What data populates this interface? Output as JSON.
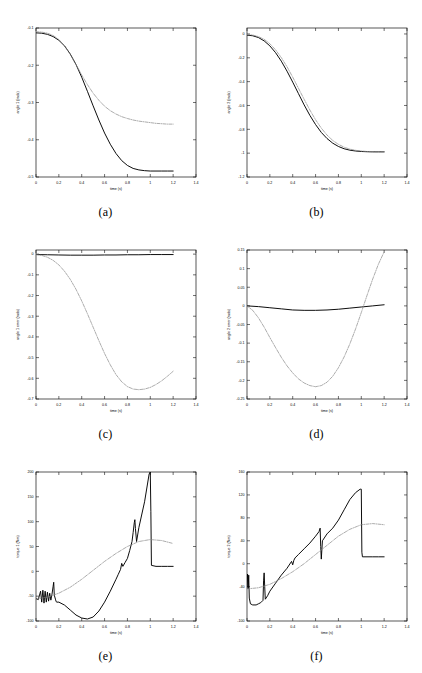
{
  "figure": {
    "name": "six-panel-simulation-results",
    "panels": [
      {
        "id": "a",
        "caption": "(a)"
      },
      {
        "id": "b",
        "caption": "(b)"
      },
      {
        "id": "c",
        "caption": "(c)"
      },
      {
        "id": "d",
        "caption": "(d)"
      },
      {
        "id": "e",
        "caption": "(e)"
      },
      {
        "id": "f",
        "caption": "(f)"
      }
    ]
  },
  "chart_data": [
    {
      "id": "a",
      "type": "line",
      "title": "",
      "xlabel": "time (s)",
      "ylabel": "angle 1 (rads)",
      "xlim": [
        0,
        1.4
      ],
      "ylim": [
        -0.5,
        -0.1
      ],
      "xticks": [
        0,
        0.2,
        0.4,
        0.6,
        0.8,
        1,
        1.2,
        1.4
      ],
      "xticklabels": [
        "0",
        "0.2",
        "0.4",
        "0.6",
        "0.8",
        "1",
        "1.2",
        "1.4"
      ],
      "yticks": [
        -0.1,
        -0.2,
        -0.3,
        -0.4,
        -0.5
      ],
      "yticklabels": [
        "-0.1",
        "-0.2",
        "-0.3",
        "-0.4",
        "-0.5"
      ],
      "grid": false,
      "legend": null,
      "series": [
        {
          "name": "actual",
          "style": "solid",
          "color": "#000000",
          "x": [
            0,
            0.05,
            0.1,
            0.15,
            0.2,
            0.25,
            0.3,
            0.35,
            0.4,
            0.45,
            0.5,
            0.55,
            0.6,
            0.65,
            0.7,
            0.75,
            0.8,
            0.85,
            0.9,
            0.95,
            1,
            1.05,
            1.1,
            1.15,
            1.2
          ],
          "y": [
            -0.113,
            -0.114,
            -0.117,
            -0.123,
            -0.133,
            -0.148,
            -0.17,
            -0.198,
            -0.232,
            -0.27,
            -0.309,
            -0.347,
            -0.382,
            -0.412,
            -0.437,
            -0.456,
            -0.469,
            -0.477,
            -0.481,
            -0.483,
            -0.484,
            -0.484,
            -0.484,
            -0.484,
            -0.484
          ]
        },
        {
          "name": "desired",
          "style": "dashdot",
          "color": "#888888",
          "x": [
            0,
            0.05,
            0.1,
            0.15,
            0.2,
            0.25,
            0.3,
            0.35,
            0.4,
            0.45,
            0.5,
            0.55,
            0.6,
            0.65,
            0.7,
            0.75,
            0.8,
            0.85,
            0.9,
            0.95,
            1,
            1.05,
            1.1,
            1.15,
            1.2
          ],
          "y": [
            -0.11,
            -0.111,
            -0.114,
            -0.12,
            -0.131,
            -0.148,
            -0.171,
            -0.198,
            -0.226,
            -0.252,
            -0.275,
            -0.294,
            -0.31,
            -0.322,
            -0.331,
            -0.338,
            -0.343,
            -0.347,
            -0.35,
            -0.352,
            -0.354,
            -0.356,
            -0.357,
            -0.358,
            -0.358
          ]
        }
      ]
    },
    {
      "id": "b",
      "type": "line",
      "title": "",
      "xlabel": "time (s)",
      "ylabel": "angle 2 (rads)",
      "xlim": [
        0,
        1.4
      ],
      "ylim": [
        -1.2,
        0.05
      ],
      "xticks": [
        0,
        0.2,
        0.4,
        0.6,
        0.8,
        1,
        1.2,
        1.4
      ],
      "xticklabels": [
        "0",
        "0.2",
        "0.4",
        "0.6",
        "0.8",
        "1",
        "1.2",
        "1.4"
      ],
      "yticks": [
        0,
        -0.2,
        -0.4,
        -0.6,
        -0.8,
        -1,
        -1.2
      ],
      "yticklabels": [
        "0",
        "-0.2",
        "-0.4",
        "-0.6",
        "-0.8",
        "-1",
        "-1.2"
      ],
      "grid": false,
      "legend": null,
      "series": [
        {
          "name": "actual",
          "style": "solid",
          "color": "#000000",
          "x": [
            0,
            0.05,
            0.1,
            0.15,
            0.2,
            0.25,
            0.3,
            0.35,
            0.4,
            0.45,
            0.5,
            0.55,
            0.6,
            0.65,
            0.7,
            0.75,
            0.8,
            0.85,
            0.9,
            0.95,
            1,
            1.05,
            1.1,
            1.15,
            1.2
          ],
          "y": [
            -0.01,
            -0.015,
            -0.03,
            -0.058,
            -0.1,
            -0.157,
            -0.228,
            -0.312,
            -0.404,
            -0.5,
            -0.595,
            -0.683,
            -0.76,
            -0.826,
            -0.877,
            -0.916,
            -0.944,
            -0.963,
            -0.975,
            -0.982,
            -0.986,
            -0.988,
            -0.989,
            -0.989,
            -0.989
          ]
        },
        {
          "name": "desired",
          "style": "dashdot",
          "color": "#888888",
          "x": [
            0,
            0.05,
            0.1,
            0.15,
            0.2,
            0.25,
            0.3,
            0.35,
            0.4,
            0.45,
            0.5,
            0.55,
            0.6,
            0.65,
            0.7,
            0.75,
            0.8,
            0.85,
            0.9,
            0.95,
            1,
            1.05,
            1.1,
            1.15,
            1.2
          ],
          "y": [
            -0.005,
            -0.009,
            -0.022,
            -0.045,
            -0.082,
            -0.133,
            -0.198,
            -0.275,
            -0.362,
            -0.455,
            -0.548,
            -0.638,
            -0.72,
            -0.79,
            -0.848,
            -0.893,
            -0.926,
            -0.95,
            -0.966,
            -0.976,
            -0.982,
            -0.986,
            -0.988,
            -0.989,
            -0.989
          ]
        }
      ]
    },
    {
      "id": "c",
      "type": "line",
      "title": "",
      "xlabel": "time (s)",
      "ylabel": "angle 1 error (rads)",
      "xlim": [
        0,
        1.4
      ],
      "ylim": [
        -0.7,
        0.02
      ],
      "xticks": [
        0,
        0.2,
        0.4,
        0.6,
        0.8,
        1,
        1.2,
        1.4
      ],
      "xticklabels": [
        "0",
        "0.2",
        "0.4",
        "0.6",
        "0.8",
        "1",
        "1.2",
        "1.4"
      ],
      "yticks": [
        0,
        -0.1,
        -0.2,
        -0.3,
        -0.4,
        -0.5,
        -0.6,
        -0.7
      ],
      "yticklabels": [
        "0",
        "-0.1",
        "-0.2",
        "-0.3",
        "-0.4",
        "-0.5",
        "-0.6",
        "-0.7"
      ],
      "grid": false,
      "legend": null,
      "series": [
        {
          "name": "actual",
          "style": "solid",
          "color": "#000000",
          "x": [
            0,
            0.1,
            0.2,
            0.3,
            0.4,
            0.5,
            0.6,
            0.7,
            0.8,
            0.9,
            1,
            1.1,
            1.2
          ],
          "y": [
            -0.002,
            -0.003,
            -0.004,
            -0.005,
            -0.005,
            -0.005,
            -0.004,
            -0.004,
            -0.003,
            -0.003,
            -0.002,
            -0.002,
            -0.002
          ]
        },
        {
          "name": "desired",
          "style": "dashdot",
          "color": "#888888",
          "x": [
            0,
            0.05,
            0.1,
            0.15,
            0.2,
            0.25,
            0.3,
            0.35,
            0.4,
            0.45,
            0.5,
            0.55,
            0.6,
            0.65,
            0.7,
            0.75,
            0.8,
            0.85,
            0.9,
            0.95,
            1,
            1.05,
            1.1,
            1.15,
            1.2
          ],
          "y": [
            -0.002,
            -0.006,
            -0.015,
            -0.03,
            -0.052,
            -0.083,
            -0.122,
            -0.17,
            -0.226,
            -0.288,
            -0.353,
            -0.418,
            -0.48,
            -0.535,
            -0.582,
            -0.617,
            -0.64,
            -0.652,
            -0.655,
            -0.652,
            -0.644,
            -0.63,
            -0.612,
            -0.59,
            -0.566
          ]
        }
      ]
    },
    {
      "id": "d",
      "type": "line",
      "title": "",
      "xlabel": "time (s)",
      "ylabel": "angle 2 error (rads)",
      "xlim": [
        0,
        1.4
      ],
      "ylim": [
        -0.25,
        0.15
      ],
      "xticks": [
        0,
        0.2,
        0.4,
        0.6,
        0.8,
        1,
        1.2,
        1.4
      ],
      "xticklabels": [
        "0",
        "0.2",
        "0.4",
        "0.6",
        "0.8",
        "1",
        "1.2",
        "1.4"
      ],
      "yticks": [
        0.15,
        0.1,
        0.05,
        0,
        -0.05,
        -0.1,
        -0.15,
        -0.2,
        -0.25
      ],
      "yticklabels": [
        "0.15",
        "0.1",
        "0.05",
        "0",
        "-0.05",
        "-0.1",
        "-0.15",
        "-0.2",
        "-0.25"
      ],
      "grid": false,
      "legend": null,
      "series": [
        {
          "name": "actual",
          "style": "solid",
          "color": "#000000",
          "x": [
            0,
            0.1,
            0.2,
            0.3,
            0.4,
            0.5,
            0.6,
            0.7,
            0.8,
            0.9,
            1,
            1.1,
            1.2
          ],
          "y": [
            0,
            -0.002,
            -0.005,
            -0.008,
            -0.011,
            -0.012,
            -0.012,
            -0.011,
            -0.009,
            -0.006,
            -0.003,
            0,
            0.003
          ]
        },
        {
          "name": "desired",
          "style": "dashdot",
          "color": "#888888",
          "x": [
            0,
            0.05,
            0.1,
            0.15,
            0.2,
            0.25,
            0.3,
            0.35,
            0.4,
            0.45,
            0.5,
            0.55,
            0.6,
            0.65,
            0.7,
            0.75,
            0.8,
            0.85,
            0.9,
            0.95,
            1,
            1.05,
            1.1,
            1.15,
            1.2
          ],
          "y": [
            0,
            -0.012,
            -0.032,
            -0.057,
            -0.085,
            -0.112,
            -0.138,
            -0.161,
            -0.18,
            -0.196,
            -0.207,
            -0.214,
            -0.217,
            -0.214,
            -0.205,
            -0.189,
            -0.166,
            -0.137,
            -0.102,
            -0.062,
            -0.018,
            0.028,
            0.072,
            0.112,
            0.145
          ]
        }
      ]
    },
    {
      "id": "e",
      "type": "line",
      "title": "",
      "xlabel": "time (s)",
      "ylabel": "torque 1 (Nm)",
      "xlim": [
        0,
        1.4
      ],
      "ylim": [
        -100,
        200
      ],
      "xticks": [
        0,
        0.2,
        0.4,
        0.6,
        0.8,
        1,
        1.2,
        1.4
      ],
      "xticklabels": [
        "0",
        "0.2",
        "0.4",
        "0.6",
        "0.8",
        "1",
        "1.2",
        "1.4"
      ],
      "yticks": [
        200,
        150,
        100,
        50,
        0,
        -50,
        -100
      ],
      "yticklabels": [
        "200",
        "150",
        "100",
        "50",
        "0",
        "-50",
        "-100"
      ],
      "grid": false,
      "legend": null,
      "series": [
        {
          "name": "actual",
          "style": "solid",
          "color": "#000000",
          "x": [
            0,
            0.02,
            0.04,
            0.05,
            0.06,
            0.07,
            0.08,
            0.09,
            0.1,
            0.11,
            0.12,
            0.13,
            0.14,
            0.15,
            0.155,
            0.16,
            0.17,
            0.175,
            0.18,
            0.2,
            0.25,
            0.3,
            0.35,
            0.4,
            0.45,
            0.5,
            0.55,
            0.6,
            0.65,
            0.7,
            0.72,
            0.74,
            0.75,
            0.76,
            0.78,
            0.8,
            0.82,
            0.84,
            0.85,
            0.86,
            0.865,
            0.87,
            0.88,
            0.9,
            0.95,
            0.99,
            1,
            1.005,
            1.01,
            1.05,
            1.1,
            1.15,
            1.2
          ],
          "y": [
            -55,
            -57,
            -40,
            -62,
            -38,
            -64,
            -40,
            -62,
            -42,
            -60,
            -44,
            -58,
            -46,
            -30,
            -22,
            -48,
            -56,
            -60,
            -62,
            -62,
            -68,
            -78,
            -88,
            -94,
            -96,
            -92,
            -80,
            -62,
            -40,
            -16,
            -6,
            4,
            16,
            10,
            18,
            26,
            42,
            60,
            78,
            98,
            104,
            86,
            60,
            88,
            140,
            196,
            200,
            120,
            12,
            10,
            10,
            10,
            10
          ]
        },
        {
          "name": "desired",
          "style": "dashdot",
          "color": "#888888",
          "x": [
            0,
            0.1,
            0.2,
            0.3,
            0.4,
            0.5,
            0.6,
            0.7,
            0.8,
            0.9,
            1,
            1.1,
            1.2
          ],
          "y": [
            -56,
            -52,
            -44,
            -32,
            -16,
            2,
            20,
            36,
            50,
            60,
            64,
            62,
            56
          ]
        }
      ]
    },
    {
      "id": "f",
      "type": "line",
      "title": "",
      "xlabel": "time (s)",
      "ylabel": "torque 2 (Nm)",
      "xlim": [
        0,
        1.4
      ],
      "ylim": [
        -100,
        160
      ],
      "xticks": [
        0,
        0.2,
        0.4,
        0.6,
        0.8,
        1,
        1.2,
        1.4
      ],
      "xticklabels": [
        "0",
        "0.2",
        "0.4",
        "0.6",
        "0.8",
        "1",
        "1.2",
        "1.4"
      ],
      "yticks": [
        160,
        120,
        80,
        40,
        0,
        -40,
        -100
      ],
      "yticklabels": [
        "160",
        "120",
        "80",
        "40",
        "0",
        "-40",
        "-100"
      ],
      "grid": false,
      "legend": null,
      "series": [
        {
          "name": "actual",
          "style": "solid",
          "color": "#000000",
          "x": [
            0,
            0.005,
            0.01,
            0.015,
            0.02,
            0.03,
            0.05,
            0.08,
            0.1,
            0.12,
            0.14,
            0.145,
            0.15,
            0.155,
            0.16,
            0.18,
            0.2,
            0.25,
            0.3,
            0.35,
            0.39,
            0.4,
            0.41,
            0.42,
            0.45,
            0.5,
            0.55,
            0.6,
            0.63,
            0.64,
            0.645,
            0.65,
            0.66,
            0.7,
            0.75,
            0.8,
            0.85,
            0.9,
            0.95,
            0.99,
            1,
            1.005,
            1.01,
            1.05,
            1.1,
            1.15,
            1.2
          ],
          "y": [
            -40,
            -18,
            -44,
            -20,
            -60,
            -70,
            -72,
            -72,
            -70,
            -68,
            -64,
            -30,
            -16,
            -40,
            -62,
            -56,
            -48,
            -34,
            -20,
            -8,
            4,
            -2,
            6,
            10,
            16,
            26,
            36,
            48,
            56,
            62,
            30,
            8,
            40,
            52,
            62,
            76,
            94,
            112,
            124,
            130,
            130,
            20,
            12,
            12,
            12,
            12,
            12
          ]
        },
        {
          "name": "desired",
          "style": "dashdot",
          "color": "#888888",
          "x": [
            0,
            0.1,
            0.2,
            0.3,
            0.4,
            0.5,
            0.6,
            0.7,
            0.8,
            0.9,
            1,
            1.1,
            1.2
          ],
          "y": [
            -44,
            -42,
            -36,
            -26,
            -14,
            0,
            16,
            32,
            48,
            60,
            68,
            70,
            68
          ]
        }
      ]
    }
  ]
}
